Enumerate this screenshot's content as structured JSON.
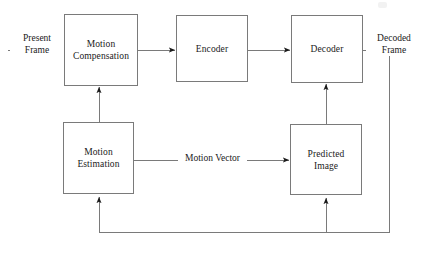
{
  "diagram": {
    "line_color": "#7a7a7a",
    "arrow_color": "#1a1a1a",
    "text_color": "#1a1a1a",
    "background": "#ffffff",
    "nodes": [
      {
        "id": "motion_compensation",
        "label": "Motion\nCompensation",
        "x": 64,
        "y": 14,
        "w": 74,
        "h": 72
      },
      {
        "id": "encoder",
        "label": "Encoder",
        "x": 176,
        "y": 15,
        "w": 72,
        "h": 67
      },
      {
        "id": "decoder",
        "label": "Decoder",
        "x": 291,
        "y": 15,
        "w": 72,
        "h": 68
      },
      {
        "id": "motion_estimation",
        "label": "Motion\nEstimation",
        "x": 63,
        "y": 122,
        "w": 71,
        "h": 72
      },
      {
        "id": "predicted_image",
        "label": "Predicted\nImage",
        "x": 290,
        "y": 124,
        "w": 72,
        "h": 71
      }
    ],
    "edge_labels": [
      {
        "id": "present_frame",
        "label": "Present\nFrame",
        "x": 10,
        "y": 33
      },
      {
        "id": "decoded_frame",
        "label": "Decoded\nFrame",
        "x": 366,
        "y": 33
      },
      {
        "id": "motion_vector",
        "label": "Motion Vector",
        "x": 178,
        "y": 153
      }
    ],
    "connections": [
      {
        "id": "input-to-motion-compensation",
        "from": "present_frame",
        "to": "motion_compensation"
      },
      {
        "id": "motion-compensation-to-encoder",
        "from": "motion_compensation",
        "to": "encoder"
      },
      {
        "id": "encoder-to-decoder",
        "from": "encoder",
        "to": "decoder"
      },
      {
        "id": "decoder-to-output",
        "from": "decoder",
        "to": "decoded_frame"
      },
      {
        "id": "motion-estimation-to-motion-compensation",
        "from": "motion_estimation",
        "to": "motion_compensation"
      },
      {
        "id": "motion-estimation-to-predicted-image",
        "from": "motion_estimation",
        "to": "predicted_image"
      },
      {
        "id": "predicted-image-to-decoder",
        "from": "predicted_image",
        "to": "decoder"
      },
      {
        "id": "feedback-to-motion-estimation",
        "from": "decoder_output_bus",
        "to": "motion_estimation"
      },
      {
        "id": "feedback-to-predicted-image",
        "from": "decoder_output_bus",
        "to": "predicted_image"
      }
    ]
  }
}
